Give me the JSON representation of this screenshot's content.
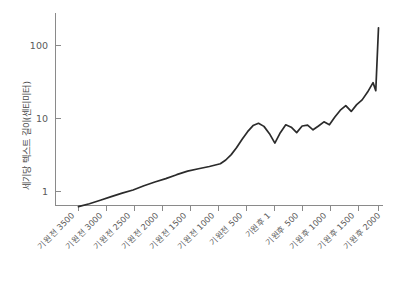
{
  "chart_data": {
    "type": "line",
    "title": "",
    "xlabel": "",
    "ylabel": "세기당 텍스트 길이(센티미터)",
    "yscale": "log",
    "ylim": [
      0.45,
      260
    ],
    "xlim": [
      -3500,
      2000
    ],
    "grid": false,
    "legend": null,
    "ytick_labels": [
      "100",
      "10",
      "1"
    ],
    "ytick_values": [
      100,
      10,
      1
    ],
    "xtick_labels": [
      "기원전 3500",
      "기원전 3000",
      "기원전 2500",
      "기원전 2000",
      "기원전 1500",
      "기원전 1000",
      "기원전 500",
      "기원후 1",
      "기원후 500",
      "기원후 1000",
      "기원후 1500",
      "기원후 2000"
    ],
    "xtick_values": [
      -3500,
      -3000,
      -2500,
      -2000,
      -1500,
      -1000,
      -500,
      1,
      500,
      1000,
      1500,
      2000
    ],
    "line_color": "#2b2b2b",
    "axis_color": "#8a8a8a",
    "series": [
      {
        "name": "세기당 텍스트 길이",
        "x": [
          -3500,
          -3300,
          -3100,
          -2900,
          -2700,
          -2500,
          -2300,
          -2100,
          -1900,
          -1700,
          -1500,
          -1300,
          -1100,
          -900,
          -800,
          -700,
          -600,
          -500,
          -400,
          -300,
          -200,
          -100,
          1,
          100,
          200,
          300,
          400,
          500,
          600,
          700,
          800,
          900,
          1000,
          1100,
          1200,
          1300,
          1400,
          1500,
          1600,
          1700,
          1800,
          1900,
          1950,
          2000
        ],
        "values": [
          0.62,
          0.68,
          0.76,
          0.85,
          0.95,
          1.05,
          1.2,
          1.35,
          1.5,
          1.7,
          1.9,
          2.05,
          2.2,
          2.4,
          2.7,
          3.2,
          4.0,
          5.2,
          6.6,
          8.0,
          8.6,
          7.8,
          6.2,
          4.6,
          6.4,
          8.2,
          7.6,
          6.4,
          7.9,
          8.1,
          7.0,
          7.9,
          9.0,
          8.2,
          10.5,
          13.0,
          15.0,
          12.5,
          15.5,
          18.0,
          23.0,
          31.0,
          24.0,
          175.0
        ]
      }
    ]
  }
}
